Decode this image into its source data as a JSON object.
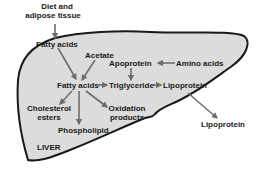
{
  "diagram": {
    "organ_label": "LIVER",
    "colors": {
      "liver_fill": "#dcdcdc",
      "outline": "#1a1a1a",
      "arrow": "#6e6e6e",
      "text": "#1a1a1a"
    },
    "nodes": {
      "diet_line1": "Diet and",
      "diet_line2": "adipose tissue",
      "fatty_acids_in": "Fatty acids",
      "acetate": "Acetate",
      "apoprotein": "Apoprotein",
      "amino_acids": "Amino acids",
      "fatty_acids_center": "Fatty acids",
      "triglyceride": "Triglyceride",
      "lipoprotein_inner": "Lipoprotein",
      "cholesterol_line1": "Cholesterol",
      "cholesterol_line2": "esters",
      "oxidation_line1": "Oxidation",
      "oxidation_line2": "products",
      "phospholipid": "Phospholipid",
      "lipoprotein_out": "Lipoprotein"
    },
    "edges": [
      {
        "from": "Diet and adipose tissue",
        "to": "Fatty acids"
      },
      {
        "from": "Fatty acids",
        "to": "Fatty acids (center)"
      },
      {
        "from": "Acetate",
        "to": "Fatty acids (center)"
      },
      {
        "from": "Amino acids",
        "to": "Apoprotein"
      },
      {
        "from": "Apoprotein",
        "to": "Triglyceride"
      },
      {
        "from": "Fatty acids (center)",
        "to": "Triglyceride"
      },
      {
        "from": "Triglyceride",
        "to": "Lipoprotein"
      },
      {
        "from": "Fatty acids (center)",
        "to": "Cholesterol esters"
      },
      {
        "from": "Fatty acids (center)",
        "to": "Phospholipid"
      },
      {
        "from": "Fatty acids (center)",
        "to": "Oxidation products"
      },
      {
        "from": "Lipoprotein",
        "to": "Lipoprotein (exported)"
      }
    ]
  }
}
